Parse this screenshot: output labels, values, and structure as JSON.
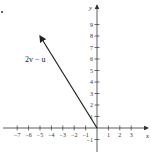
{
  "figure": {
    "type": "vector-plot",
    "x_axis": {
      "label": "x",
      "ticks": [
        -7,
        -6,
        -5,
        -4,
        -3,
        -2,
        -1,
        1,
        2,
        3
      ]
    },
    "y_axis": {
      "label": "y",
      "ticks": [
        -1,
        1,
        2,
        3,
        4,
        5,
        6,
        7,
        8,
        9
      ]
    },
    "vector": {
      "label": "2v − u",
      "from": [
        0,
        0
      ],
      "to": [
        -5,
        8
      ]
    },
    "colors": {
      "axis": "#333333",
      "vector": "#222222"
    }
  }
}
